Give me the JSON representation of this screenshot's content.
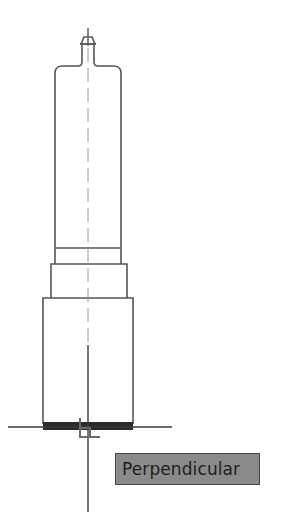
{
  "viewport": {
    "width": 283,
    "height": 526,
    "background": "#ffffff"
  },
  "drawing": {
    "line_color": "#555555",
    "centerline_color": "#9a9a9a",
    "highlight_color": "#2b2b2b",
    "crosshair_color": "#3a3a3a",
    "centerline_x": 88
  },
  "osnap": {
    "marker": "perpendicular-marker",
    "tooltip_label": "Perpendicular",
    "tooltip_bg": "#8a8a8a"
  },
  "cursor": {
    "x": 88,
    "y": 427
  }
}
